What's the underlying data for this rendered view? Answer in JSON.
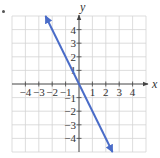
{
  "chart_data": {
    "type": "line",
    "title": "",
    "xlabel": "x",
    "ylabel": "y",
    "xlim": [
      -5,
      5
    ],
    "ylim": [
      -5,
      5
    ],
    "grid": true,
    "x_ticks": [
      -4,
      -3,
      -2,
      -1,
      1,
      2,
      3,
      4
    ],
    "y_ticks": [
      4,
      3,
      2,
      1,
      -1,
      -2,
      -3,
      -4
    ],
    "x_tick_labels": [
      "−4",
      "−3",
      "−2",
      "−1",
      "1",
      "2",
      "3",
      "4"
    ],
    "y_tick_labels": [
      "4",
      "3",
      "2",
      "1",
      "−1",
      "−2",
      "−3",
      "−4"
    ],
    "series": [
      {
        "name": "y = -2x",
        "equation": "y = -2x",
        "slope": -2,
        "intercept": 0,
        "x": [
          -2.5,
          0,
          2.5
        ],
        "y": [
          5,
          0,
          -5
        ],
        "color": "#4a6cc8",
        "arrows": "both"
      }
    ],
    "legend": null
  },
  "colors": {
    "line": "#4a6cc8",
    "grid": "#d4d4d4",
    "axis": "#444444"
  }
}
